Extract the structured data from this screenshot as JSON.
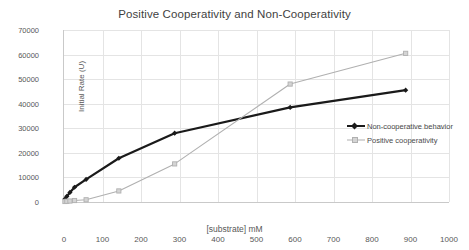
{
  "chart_data": {
    "type": "line",
    "title": "Positive Cooperativity and Non-Cooperativity",
    "xlabel": "[substrate] mM",
    "ylabel": "Initial Rate (U)",
    "xlim": [
      0,
      1000
    ],
    "ylim": [
      0,
      70000
    ],
    "xticks": [
      0,
      100,
      200,
      300,
      400,
      500,
      600,
      700,
      800,
      900,
      1000
    ],
    "yticks": [
      0,
      10000,
      20000,
      30000,
      40000,
      50000,
      60000,
      70000
    ],
    "grid": true,
    "legend_position": "center-right",
    "series": [
      {
        "name": "Non-cooperative behavior",
        "color": "#1a1a1a",
        "marker": "diamond",
        "line_width": 2.2,
        "points": [
          {
            "x": 5,
            "y": 1200
          },
          {
            "x": 10,
            "y": 2300
          },
          {
            "x": 18,
            "y": 3900
          },
          {
            "x": 30,
            "y": 6000
          },
          {
            "x": 60,
            "y": 9200
          },
          {
            "x": 145,
            "y": 17800
          },
          {
            "x": 290,
            "y": 28000
          },
          {
            "x": 590,
            "y": 38500
          },
          {
            "x": 890,
            "y": 45500
          }
        ]
      },
      {
        "name": "Positive cooperativity",
        "color": "#b0b0b0",
        "marker": "square",
        "line_width": 1.1,
        "points": [
          {
            "x": 5,
            "y": 200
          },
          {
            "x": 10,
            "y": 300
          },
          {
            "x": 18,
            "y": 400
          },
          {
            "x": 30,
            "y": 600
          },
          {
            "x": 60,
            "y": 900
          },
          {
            "x": 145,
            "y": 4500
          },
          {
            "x": 290,
            "y": 15500
          },
          {
            "x": 590,
            "y": 48000
          },
          {
            "x": 890,
            "y": 60500
          }
        ]
      }
    ]
  }
}
